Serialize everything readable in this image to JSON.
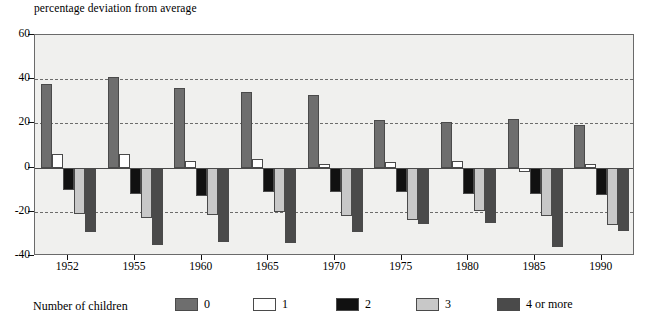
{
  "chart_data": {
    "type": "bar",
    "title": "percentage deviation from average",
    "xlabel": "",
    "ylabel": "percentage deviation from average",
    "ylim": [
      -40,
      60
    ],
    "yticks": [
      60,
      40,
      20,
      0,
      -20,
      -40
    ],
    "grid": "horizontal dashed at 40, 20, -20",
    "legend_position": "bottom",
    "legend_title": "Number of children",
    "categories": [
      "1952",
      "1955",
      "1960",
      "1965",
      "1970",
      "1975",
      "1980",
      "1985",
      "1990"
    ],
    "series": [
      {
        "name": "0",
        "color": "#6e6e6e",
        "values": [
          38,
          41,
          36,
          34,
          33,
          21.5,
          20.5,
          22,
          19.5
        ]
      },
      {
        "name": "1",
        "color": "#ffffff",
        "values": [
          6,
          6,
          3,
          4,
          1.5,
          2.5,
          3,
          -2,
          1.5
        ]
      },
      {
        "name": "2",
        "color": "#111111",
        "values": [
          -10,
          -12,
          -13,
          -11,
          -11,
          -11,
          -12,
          -12,
          -12.5
        ]
      },
      {
        "name": "3",
        "color": "#c8c8c8",
        "values": [
          -21,
          -23,
          -21.5,
          -20,
          -22,
          -23.5,
          -19.5,
          -22,
          -26
        ]
      },
      {
        "name": "4 or more",
        "color": "#4a4a4a",
        "values": [
          -29,
          -35,
          -33.5,
          -34,
          -29,
          -25.5,
          -25,
          -36,
          -28.5
        ]
      }
    ]
  },
  "legend": {
    "title": "Number of children",
    "items": [
      {
        "label": "0"
      },
      {
        "label": "1"
      },
      {
        "label": "2"
      },
      {
        "label": "3"
      },
      {
        "label": "4 or more"
      }
    ]
  },
  "colors": {
    "plot_background": "#f0f0ee",
    "frame": "#6a6a6a",
    "gridline": "#555555",
    "text": "#000000"
  }
}
